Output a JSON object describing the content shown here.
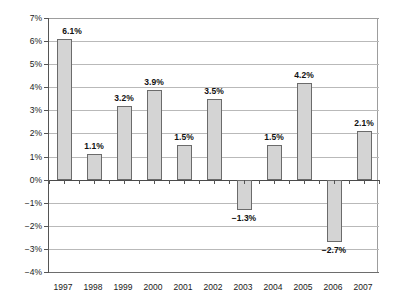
{
  "chart_data": {
    "type": "bar",
    "title": "",
    "subtitle": "",
    "xlabel": "",
    "ylabel": "",
    "categories": [
      "1997",
      "1998",
      "1999",
      "2000",
      "2001",
      "2002",
      "2003",
      "2004",
      "2005",
      "2006",
      "2007"
    ],
    "values": [
      6.1,
      1.1,
      3.2,
      3.9,
      1.5,
      3.5,
      -1.3,
      1.5,
      4.2,
      -2.7,
      2.1
    ],
    "data_labels": [
      "6.1%",
      "1.1%",
      "3.2%",
      "3.9%",
      "1.5%",
      "3.5%",
      "−1.3%",
      "1.5%",
      "4.2%",
      "−2.7%",
      "2.1%"
    ],
    "ylim": [
      -4,
      7
    ],
    "ytick_values": [
      7,
      6,
      5,
      4,
      3,
      2,
      1,
      0,
      -1,
      -2,
      -3,
      -4
    ],
    "ytick_labels": [
      "7%",
      "6%",
      "5%",
      "4%",
      "3%",
      "2%",
      "1%",
      "0%",
      "−1%",
      "−2%",
      "−3%",
      "−4%"
    ],
    "grid": true,
    "legend": false,
    "legend_position": "none",
    "units": "percent",
    "series_name": "",
    "colors": {
      "bar_fill": "#d4d4d4",
      "bar_border": "#6b6b6b",
      "gridline": "#b9b9b9",
      "axis": "#555555",
      "text": "#1a1a1a",
      "background": "#ffffff"
    }
  }
}
